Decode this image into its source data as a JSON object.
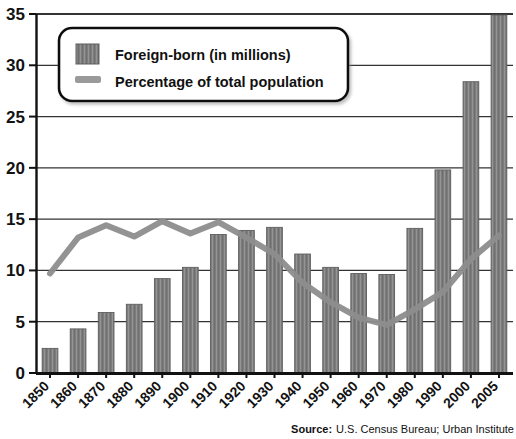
{
  "chart_data": {
    "type": "bar",
    "title": "",
    "xlabel": "",
    "ylabel": "",
    "ylim": [
      0,
      35
    ],
    "yticks": [
      0,
      5,
      10,
      15,
      20,
      25,
      30,
      35
    ],
    "grid": true,
    "legend_position": "top-left",
    "categories": [
      "1850",
      "1860",
      "1870",
      "1880",
      "1890",
      "1900",
      "1910",
      "1920",
      "1930",
      "1940",
      "1950",
      "1960",
      "1970",
      "1980",
      "1990",
      "2000",
      "2005"
    ],
    "series": [
      {
        "name": "Foreign-born (in millions)",
        "type": "bar",
        "color": "#7d7d7d",
        "values": [
          2.4,
          4.3,
          5.9,
          6.7,
          9.2,
          10.3,
          13.5,
          13.9,
          14.2,
          11.6,
          10.3,
          9.7,
          9.6,
          14.1,
          19.8,
          28.4,
          35.2
        ],
        "clipped_at_top": [
          "2005"
        ]
      },
      {
        "name": "Percentage of total population",
        "type": "line",
        "color": "#8d8d8d",
        "values": [
          9.7,
          13.2,
          14.4,
          13.3,
          14.8,
          13.6,
          14.7,
          13.2,
          11.6,
          8.8,
          6.9,
          5.4,
          4.7,
          6.2,
          7.9,
          11.1,
          13.4
        ]
      }
    ],
    "legend": [
      {
        "label": "Foreign-born (in millions)",
        "marker": "bar-swatch"
      },
      {
        "label": "Percentage of total population",
        "marker": "line-swatch"
      }
    ],
    "source": {
      "prefix": "Source:",
      "text": "U.S. Census Bureau; Urban Institute"
    }
  },
  "colors": {
    "bar": "#7d7d7d",
    "bar_stripe": "#9b9b9b",
    "bar_edge": "#5e5e5e",
    "line": "#8d8d8d",
    "axis": "#111111",
    "grid": "#333333",
    "text": "#121212",
    "legend_border": "#111111",
    "background": "#ffffff"
  }
}
